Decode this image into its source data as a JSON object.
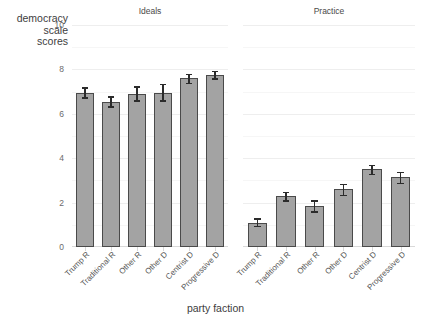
{
  "chart_data": {
    "type": "bar",
    "title": "",
    "xlabel": "party faction",
    "ylabel": "democracy scale scores",
    "ylabel_lines": [
      "democracy",
      "scale",
      "scores"
    ],
    "ylim": [
      0,
      10
    ],
    "yticks": [
      0,
      2,
      4,
      6,
      8,
      10
    ],
    "ytick_labels": [
      "0",
      "2",
      "4",
      "6",
      "8",
      "10"
    ],
    "grid": true,
    "legend": "none",
    "categories": [
      "Trump R",
      "Traditional R",
      "Other R",
      "Other D",
      "Centrist D",
      "Progressive D"
    ],
    "panels": [
      {
        "label": "Ideals",
        "values": [
          6.95,
          6.55,
          6.9,
          6.95,
          7.6,
          7.75
        ],
        "err_low": [
          6.75,
          6.35,
          6.6,
          6.6,
          7.4,
          7.6
        ],
        "err_high": [
          7.2,
          6.8,
          7.25,
          7.35,
          7.8,
          7.95
        ]
      },
      {
        "label": "Practice",
        "values": [
          1.1,
          2.3,
          1.85,
          2.6,
          3.5,
          3.15
        ],
        "err_low": [
          0.95,
          2.1,
          1.6,
          2.35,
          3.3,
          2.9
        ],
        "err_high": [
          1.3,
          2.5,
          2.1,
          2.85,
          3.7,
          3.4
        ]
      }
    ],
    "bar_fill_color": "#a3a3a3",
    "bar_outline_color": "#4a4a4a",
    "error_bar_color": "#2b2b2b",
    "grid_color": "#eeeeee",
    "axis_text_color": "#6b6b6b"
  }
}
